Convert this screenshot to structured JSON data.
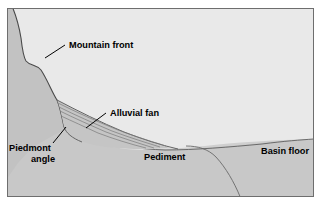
{
  "figure": {
    "kind": "geomorphology-cross-section-diagram",
    "title_text": "",
    "frame": {
      "x": 7,
      "y": 8,
      "width": 307,
      "height": 189,
      "border_color": "#6e6e6e",
      "border_width": 1
    },
    "colors": {
      "sky": "#e9e9e9",
      "mountain": "#c2c2c2",
      "pediment": "#c8c8c8",
      "basin_fill": "#cfcfcf",
      "alluvial_fan": "#c5c5c5",
      "outline": "#4a4a4a",
      "label_text": "#000000",
      "leader_line": "#000000",
      "page_background": "#ffffff"
    },
    "labels": [
      {
        "id": "mountain-front",
        "text": "Mountain front",
        "x": 67,
        "y": 48,
        "anchor": "start",
        "leader": {
          "x1": 57,
          "y1": 45,
          "x2": 45,
          "y2": 58
        }
      },
      {
        "id": "alluvial-fan",
        "text": "Alluvial fan",
        "x": 108,
        "y": 114,
        "anchor": "start",
        "leader": {
          "x1": 106,
          "y1": 114,
          "x2": 88,
          "y2": 128
        }
      },
      {
        "id": "piedmont-angle",
        "text": "Piedmont",
        "text_line2": "angle",
        "x": 9,
        "y": 151,
        "y2": 162,
        "anchor": "start",
        "leader": {
          "x1": 52,
          "y1": 143,
          "x2": 64,
          "y2": 128
        }
      },
      {
        "id": "pediment",
        "text": "Pediment",
        "x": 144,
        "y": 160,
        "anchor": "start",
        "leader": null
      },
      {
        "id": "basin-floor",
        "text": "Basin floor",
        "x": 261,
        "y": 154,
        "anchor": "start",
        "leader": null
      }
    ],
    "geometry_notes": {
      "mountain_crest_start": "top-left at frame edge",
      "fan_apex": [
        57,
        100
      ],
      "fan_radiating_lines": 4,
      "buried_bedrock_curve": "descends from pediment at x=213 down to x=252 at frame bottom",
      "basin_surface": "gentle concave slope from pediment toe rightward to right frame edge"
    }
  }
}
